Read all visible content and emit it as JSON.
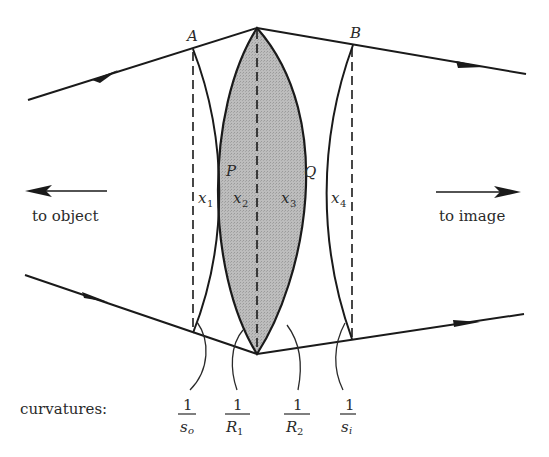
{
  "diagram": {
    "points": {
      "A": "A",
      "B": "B",
      "P": "P",
      "Q": "Q"
    },
    "regions": [
      {
        "var": "x",
        "sub": "1"
      },
      {
        "var": "x",
        "sub": "2"
      },
      {
        "var": "x",
        "sub": "3"
      },
      {
        "var": "x",
        "sub": "4"
      }
    ],
    "directions": {
      "left": "to object",
      "right": "to image"
    },
    "curvatures_label": "curvatures:",
    "curvatures": [
      {
        "num": "1",
        "den": "s",
        "den_sub": "o"
      },
      {
        "num": "1",
        "den": "R",
        "den_sub": "1"
      },
      {
        "num": "1",
        "den": "R",
        "den_sub": "2"
      },
      {
        "num": "1",
        "den": "s",
        "den_sub": "i"
      }
    ],
    "colors": {
      "line": "#1a1a1a",
      "lens_fill": "#b4b4b4",
      "background": "#ffffff"
    }
  }
}
